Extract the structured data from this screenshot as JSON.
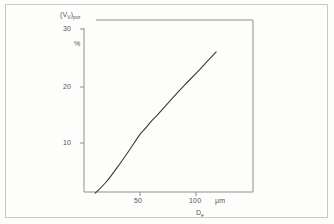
{
  "page": {
    "background_color": "#fdfdfc",
    "border_color": "#c9c9c6"
  },
  "axis": {
    "y_label_main": "(V",
    "y_label_sub1": "V",
    "y_label_mid": ")",
    "y_label_sub2": "por",
    "y_label_full": "(Vv)por",
    "y_unit": "%",
    "x_unit": "µm",
    "x_title_main": "D",
    "x_title_sub": "e",
    "x_title_full": "De",
    "y_ticks": [
      "30",
      "20",
      "10"
    ],
    "x_ticks": [
      "50",
      "100"
    ]
  },
  "chart_data": {
    "type": "line",
    "title": "",
    "subtitle": "",
    "xlabel": "De",
    "ylabel": "(Vv)por",
    "x_unit": "µm",
    "y_unit": "%",
    "xlim": [
      0,
      130
    ],
    "ylim": [
      0,
      32
    ],
    "xticks": [
      50,
      100
    ],
    "yticks": [
      10,
      20,
      30
    ],
    "grid": false,
    "legend": null,
    "legend_position": "none",
    "series": [
      {
        "name": "pore volume fraction",
        "x": [
          10,
          20,
          30,
          40,
          50,
          55,
          60,
          65,
          70,
          80,
          90,
          100,
          110,
          118
        ],
        "y": [
          1.2,
          3.2,
          5.8,
          8.6,
          11.5,
          12.6,
          13.8,
          14.8,
          15.9,
          18.1,
          20.2,
          22.2,
          24.3,
          26.0
        ]
      }
    ],
    "annotations": [],
    "curve_color": "#3a3a38",
    "axis_color": "#8f8f8c"
  }
}
